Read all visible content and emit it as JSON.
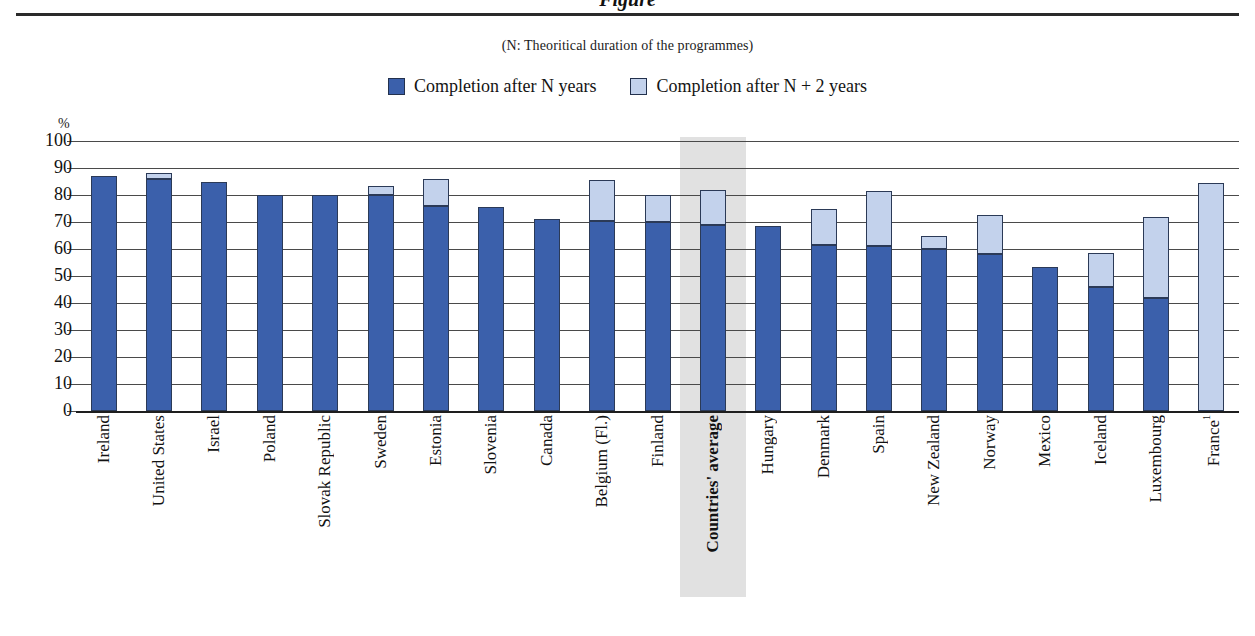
{
  "header": {
    "title_fragment": "Figure",
    "subtitle": "(N: Theoritical duration of  the programmes)"
  },
  "legend": {
    "items": [
      {
        "label": "Completion after N years",
        "color": "#3b60ab",
        "key": "n_years"
      },
      {
        "label": "Completion after N + 2 years",
        "color": "#c3d2ec",
        "key": "n_plus_2_years"
      }
    ]
  },
  "axis": {
    "unit_label": "%",
    "yticks": [
      "100",
      "90",
      "80",
      "70",
      "60",
      "50",
      "40",
      "30",
      "20",
      "10",
      "0"
    ]
  },
  "highlight": {
    "category": "Countries' average"
  },
  "chart_data": {
    "type": "bar",
    "stacked": true,
    "title": "Figure",
    "subtitle": "(N: Theoritical duration of  the programmes)",
    "xlabel": "",
    "ylabel": "%",
    "ylim": [
      0,
      100
    ],
    "ytick_step": 10,
    "grid": true,
    "legend_position": "top-center",
    "categories": [
      "Ireland",
      "United States",
      "Israel",
      "Poland",
      "Slovak Republic",
      "Sweden",
      "Estonia",
      "Slovenia",
      "Canada",
      "Belgium (Fl.)",
      "Finland",
      "Countries' average",
      "Hungary",
      "Denmark",
      "Spain",
      "New Zealand",
      "Norway",
      "Mexico",
      "Iceland",
      "Luxembourg",
      "France"
    ],
    "category_superscripts": {
      "France": "1"
    },
    "bold_categories": [
      "Countries' average"
    ],
    "series": [
      {
        "name": "Completion after N years",
        "color": "#3b60ab",
        "values": [
          87,
          86,
          85,
          80,
          80,
          80,
          76,
          75.5,
          71,
          70.5,
          70,
          69,
          68.5,
          61.5,
          61,
          60,
          58,
          53.5,
          46,
          42,
          0
        ]
      },
      {
        "name": "Completion after N + 2 years",
        "color": "#c3d2ec",
        "values": [
          87,
          88,
          85,
          80,
          80,
          83.5,
          86,
          75.5,
          71,
          85.5,
          80,
          82,
          68.5,
          75,
          81.5,
          65,
          72.5,
          53.5,
          58.5,
          72,
          84.5
        ]
      }
    ]
  }
}
